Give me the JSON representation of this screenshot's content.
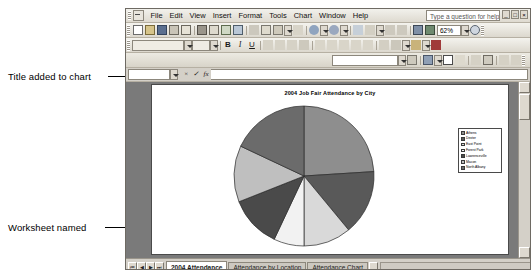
{
  "annotations": [
    {
      "id": "title-note",
      "text": "Title added to chart"
    },
    {
      "id": "worksheet-note",
      "text": "Worksheet named"
    }
  ],
  "window": {
    "help_placeholder": "Type a question for help",
    "win_minimize": "_",
    "win_restore": "□",
    "win_close": "×"
  },
  "menus": [
    {
      "label": "File"
    },
    {
      "label": "Edit"
    },
    {
      "label": "View"
    },
    {
      "label": "Insert"
    },
    {
      "label": "Format"
    },
    {
      "label": "Tools"
    },
    {
      "label": "Chart"
    },
    {
      "label": "Window"
    },
    {
      "label": "Help"
    }
  ],
  "standard_toolbar": {
    "buttons": [
      "new-icon",
      "open-icon",
      "save-icon",
      "permission-icon",
      "mail-icon",
      "print-icon",
      "print-preview-icon",
      "spelling-icon",
      "research-icon",
      "cut-icon",
      "copy-icon",
      "paste-icon",
      "format-painter-icon",
      "undo-icon",
      "redo-icon",
      "hyperlink-icon",
      "autosum-icon",
      "sort-asc-icon",
      "sort-desc-icon",
      "chart-wizard-icon",
      "drawing-icon"
    ],
    "zoom_value": "62%"
  },
  "formatting_toolbar": {
    "font_name": "",
    "font_size": "",
    "bold_label": "B",
    "italic_label": "I",
    "underline_label": "U",
    "buttons": [
      "align-left-icon",
      "align-center-icon",
      "align-right-icon",
      "merge-center-icon",
      "currency-icon",
      "percent-icon",
      "comma-icon",
      "increase-decimal-icon",
      "decrease-decimal-icon",
      "indent-icon",
      "borders-icon",
      "fill-color-icon",
      "font-color-icon"
    ]
  },
  "chart_toolbar": {
    "chart_object_value": "",
    "buttons": [
      "format-selection-icon",
      "chart-type-icon",
      "legend-icon",
      "data-table-icon",
      "by-row-icon",
      "by-column-icon",
      "angle-ccw-icon",
      "angle-cw-icon"
    ]
  },
  "formula_bar": {
    "name_box_value": "",
    "cancel_label": "×",
    "enter_label": "✓",
    "fx_label": "fx",
    "input_value": ""
  },
  "chart_data": {
    "type": "pie",
    "title": "2004 Job Fair Attendance by City",
    "legend_position": "right",
    "categories": [
      "Athens",
      "Dexter",
      "East Point",
      "Forest Park",
      "Lawrenceville",
      "Macon",
      "North Albany"
    ],
    "values": [
      24,
      15,
      11,
      7,
      12,
      13,
      18
    ],
    "colors": [
      "#8e8e8e",
      "#595959",
      "#d9d9d9",
      "#f2f2f2",
      "#4a4a4a",
      "#bfbfbf",
      "#6b6b6b"
    ],
    "start_angle": 0,
    "xlabel": "",
    "ylabel": ""
  },
  "sheet_tabs": {
    "nav_first": "⏮",
    "nav_prev": "◀",
    "nav_next": "▶",
    "nav_last": "⏭",
    "tabs": [
      {
        "label": "2004 Attendance",
        "active": true
      },
      {
        "label": "Attendance by Location",
        "active": false
      },
      {
        "label": "Attendance Chart",
        "active": false
      }
    ]
  },
  "status_bar": {
    "text": ""
  }
}
